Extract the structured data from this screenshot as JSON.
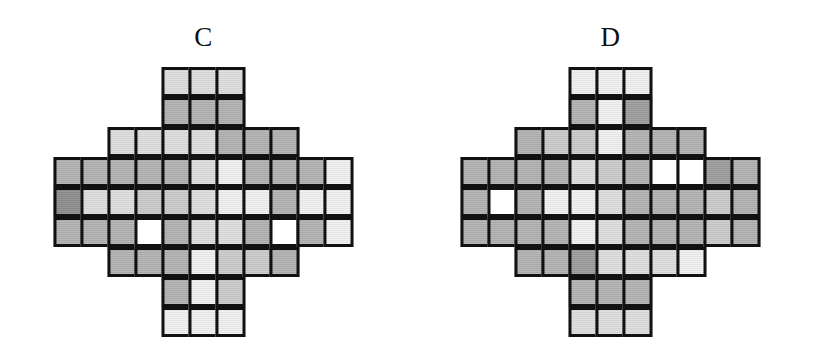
{
  "page": {
    "background": "#ffffff",
    "ink": "#111111"
  },
  "palette": {
    "white": "#ffffff",
    "vlight": "#efefef",
    "light": "#dcdcdc",
    "lightmed": "#c9c9c9",
    "med": "#b0b0b0",
    "meddark": "#9b9b9b",
    "dark": "#8c8c8c",
    "border": "#111111"
  },
  "figures": [
    {
      "id": "c",
      "label": "C",
      "cols": 11,
      "rows": 9,
      "row_widths": [
        3,
        3,
        7,
        11,
        11,
        11,
        7,
        3,
        3
      ],
      "cells": [
        [
          "light",
          "light",
          "light"
        ],
        [
          "med",
          "med",
          "med"
        ],
        [
          "light",
          "light",
          "light",
          "light",
          "med",
          "med",
          "med"
        ],
        [
          "med",
          "med",
          "med",
          "med",
          "med",
          "light",
          "vlight",
          "med",
          "med",
          "med",
          "vlight"
        ],
        [
          "dark",
          "light",
          "light",
          "lightmed",
          "lightmed",
          "light",
          "vlight",
          "vlight",
          "med",
          "vlight",
          "vlight"
        ],
        [
          "med",
          "med",
          "med",
          "white",
          "med",
          "light",
          "light",
          "med",
          "white",
          "med",
          "vlight"
        ],
        [
          "med",
          "med",
          "med",
          "vlight",
          "lightmed",
          "lightmed",
          "med"
        ],
        [
          "med",
          "vlight",
          "lightmed"
        ],
        [
          "vlight",
          "vlight",
          "vlight"
        ]
      ]
    },
    {
      "id": "d",
      "label": "D",
      "cols": 11,
      "rows": 9,
      "row_widths": [
        3,
        3,
        7,
        11,
        11,
        11,
        7,
        3,
        3
      ],
      "cells": [
        [
          "vlight",
          "vlight",
          "vlight"
        ],
        [
          "med",
          "vlight",
          "meddark"
        ],
        [
          "med",
          "lightmed",
          "lightmed",
          "vlight",
          "med",
          "med",
          "med"
        ],
        [
          "med",
          "med",
          "med",
          "med",
          "light",
          "lightmed",
          "med",
          "white",
          "white",
          "meddark",
          "med"
        ],
        [
          "med",
          "white",
          "med",
          "vlight",
          "vlight",
          "light",
          "med",
          "med",
          "med",
          "lightmed",
          "med"
        ],
        [
          "med",
          "med",
          "med",
          "med",
          "vlight",
          "light",
          "med",
          "med",
          "med",
          "lightmed",
          "med"
        ],
        [
          "med",
          "med",
          "meddark",
          "light",
          "light",
          "light",
          "vlight"
        ],
        [
          "med",
          "med",
          "med"
        ],
        [
          "light",
          "light",
          "light"
        ]
      ]
    }
  ]
}
